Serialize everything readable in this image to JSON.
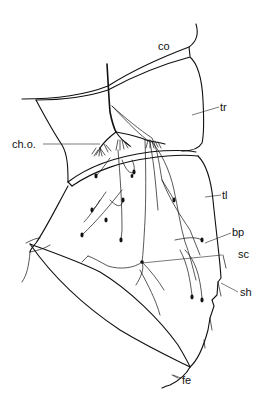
{
  "figure": {
    "type": "anatomical line drawing",
    "colors": {
      "ink": "#111111",
      "background": "#ffffff"
    },
    "labels": {
      "co": "co",
      "tr": "tr",
      "cho": "ch.o.",
      "tl": "tl",
      "bp": "bp",
      "sc": "sc",
      "sh": "sh",
      "fe": "fe"
    }
  }
}
